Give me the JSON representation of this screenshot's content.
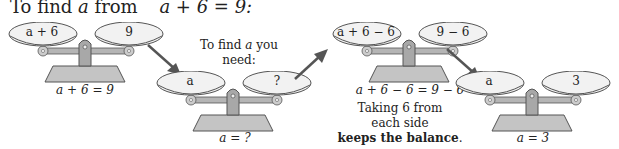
{
  "title": {
    "prefix": "To find",
    "variable": "a",
    "middle": "from",
    "equation": "a + 6 = 9:"
  },
  "scales": [
    {
      "left": "a + 6",
      "right": "9",
      "caption": "a + 6 = 9"
    },
    {
      "left": "a",
      "right": "?",
      "caption": "a = ?"
    },
    {
      "left": "a + 6 − 6",
      "right": "9 − 6",
      "caption": "a + 6 − 6 = 9 − 6"
    },
    {
      "left": "a",
      "right": "3",
      "caption": "a = 3"
    }
  ],
  "notes": {
    "need": {
      "line1_prefix": "To find",
      "line1_var": "a",
      "line1_suffix": "you",
      "line2": "need:"
    },
    "balance": {
      "line1": "Taking 6 from",
      "line2": "each side",
      "line3_bold": "keeps the balance",
      "line3_end": "."
    }
  },
  "colors": {
    "pan_fill": "#f2f2f2",
    "pan_stroke": "#555555",
    "beam": "#b5b5b5",
    "base": "#c4c4c4",
    "arrow": "#555555"
  }
}
